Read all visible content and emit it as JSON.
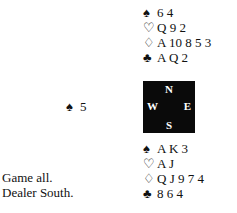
{
  "north": {
    "spades": {
      "symbol": "♠",
      "cards": "6 4"
    },
    "hearts": {
      "symbol": "♡",
      "cards": "Q 9 2"
    },
    "diamonds": {
      "symbol": "♢",
      "cards": "A 10 8 5 3"
    },
    "clubs": {
      "symbol": "♣",
      "cards": "A Q 2"
    }
  },
  "west": {
    "symbol": "♠",
    "cards": "5"
  },
  "compass": {
    "n": "N",
    "e": "E",
    "s": "S",
    "w": "W"
  },
  "south": {
    "spades": {
      "symbol": "♠",
      "cards": "A K 3"
    },
    "hearts": {
      "symbol": "♡",
      "cards": "A J"
    },
    "diamonds": {
      "symbol": "♢",
      "cards": "Q J 9 7 4"
    },
    "clubs": {
      "symbol": "♣",
      "cards": "8 6 4"
    }
  },
  "info": {
    "vulnerability": "Game all.",
    "dealer": "Dealer South."
  }
}
